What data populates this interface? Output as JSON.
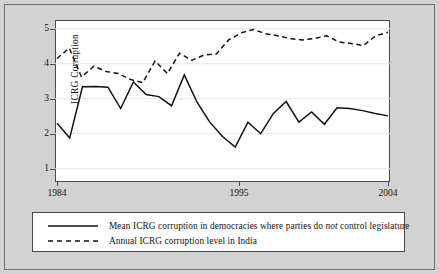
{
  "colors": {
    "background": "#d2d2d2",
    "plot_background": "#ffffff",
    "axis": "#4a4a4a",
    "grid": "#e8e8e8",
    "line": "#111111",
    "frame": "#6e6e6e"
  },
  "legend": {
    "items": [
      {
        "style": "solid",
        "label_pre": "Mean ICRG corruption in democracies where parties do ",
        "label_em": "not",
        "label_post": " control legislature",
        "label_full": "Mean ICRG corruption in democracies where parties do not control legislature"
      },
      {
        "style": "dashed",
        "label_pre": "Annual ICRG corruption level in India",
        "label_em": "",
        "label_post": "",
        "label_full": "Annual ICRG corruption level in India"
      }
    ]
  },
  "chart_data": {
    "type": "line",
    "title": "",
    "xlabel": "",
    "ylabel": "ICRG Corruption",
    "xlim": [
      1984,
      2004
    ],
    "ylim": [
      0.62,
      5.25
    ],
    "yticks": [
      1,
      2,
      3,
      4,
      5
    ],
    "ytick_labels": [
      "1",
      "2",
      "3",
      "4",
      "5"
    ],
    "xticks": [
      1984,
      1995,
      2004
    ],
    "xtick_labels": [
      "1984",
      "1995",
      "2004"
    ],
    "grid": "horizontal",
    "legend_position": "below-plot",
    "x": [
      1984,
      1985,
      1986,
      1987,
      1988,
      1989,
      1990,
      1991,
      1992,
      1993,
      1994,
      1995,
      1996,
      1997,
      1998,
      1999,
      2000,
      2001,
      2002,
      2003,
      2004
    ],
    "series": [
      {
        "name": "Mean ICRG corruption in democracies where parties do not control legislature",
        "style": "solid",
        "values": [
          2.3,
          1.88,
          3.34,
          3.35,
          3.33,
          2.72,
          3.48,
          3.12,
          3.06,
          2.8,
          3.68,
          2.9,
          2.33,
          1.92,
          1.62,
          2.33,
          2.0,
          2.58,
          2.78,
          2.92,
          2.77
        ],
        "values_note": "annual means traced from plotted vertices"
      },
      {
        "name": "Annual ICRG corruption level in India",
        "style": "dashed",
        "values": [
          4.15,
          4.45,
          3.62,
          3.93,
          3.78,
          3.72,
          3.55,
          3.46,
          4.08,
          3.72,
          4.3,
          4.1,
          4.25,
          4.28,
          4.68,
          4.88,
          4.98,
          4.86,
          4.8,
          4.7,
          4.68
        ],
        "values_note": "annual India ICRG corruption score traced from plotted vertices"
      }
    ],
    "series_extended_tail": {
      "note": "points beyond 2004 index are part of the same 21-year span; full traced vertex lists below are used for rendering",
      "solid_full": [
        2.3,
        1.88,
        3.34,
        3.35,
        3.33,
        2.72,
        3.48,
        3.12,
        3.06,
        2.8,
        3.68,
        2.9,
        2.33,
        1.92,
        1.62,
        2.33,
        2.0,
        2.58,
        2.92,
        2.33,
        2.62,
        2.27,
        2.74,
        2.72,
        2.66,
        2.58,
        2.51
      ],
      "dashed_full": [
        4.15,
        4.45,
        3.62,
        3.93,
        3.78,
        3.72,
        3.55,
        3.46,
        4.08,
        3.72,
        4.3,
        4.1,
        4.25,
        4.28,
        4.68,
        4.88,
        4.98,
        4.86,
        4.8,
        4.72,
        4.68,
        4.72,
        4.8,
        4.62,
        4.58,
        4.52,
        4.8,
        4.9
      ]
    }
  }
}
